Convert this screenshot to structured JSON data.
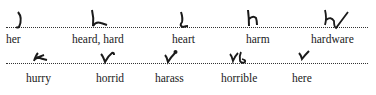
{
  "document": {
    "type": "shorthand outlines table",
    "rows": [
      {
        "entries": [
          {
            "word": "her",
            "outline": "h-r-stroke"
          },
          {
            "word": "heard, hard",
            "outline": "h-r-d-stroke"
          },
          {
            "word": "heart",
            "outline": "h-r-t-stroke"
          },
          {
            "word": "harm",
            "outline": "h-r-m-stroke"
          },
          {
            "word": "hardware",
            "outline": "h-r-d-w-r-stroke"
          }
        ]
      },
      {
        "entries": [
          {
            "word": "hurry",
            "outline": "h-r-y-stroke"
          },
          {
            "word": "horrid",
            "outline": "h-r-d-upward-stroke"
          },
          {
            "word": "harass",
            "outline": "h-r-s-stroke"
          },
          {
            "word": "horrible",
            "outline": "h-r-b-l-stroke"
          },
          {
            "word": "here",
            "outline": "h-r-upward-stroke"
          }
        ]
      }
    ],
    "ink_color": "#1a1a1a",
    "rule_style": "dotted"
  }
}
